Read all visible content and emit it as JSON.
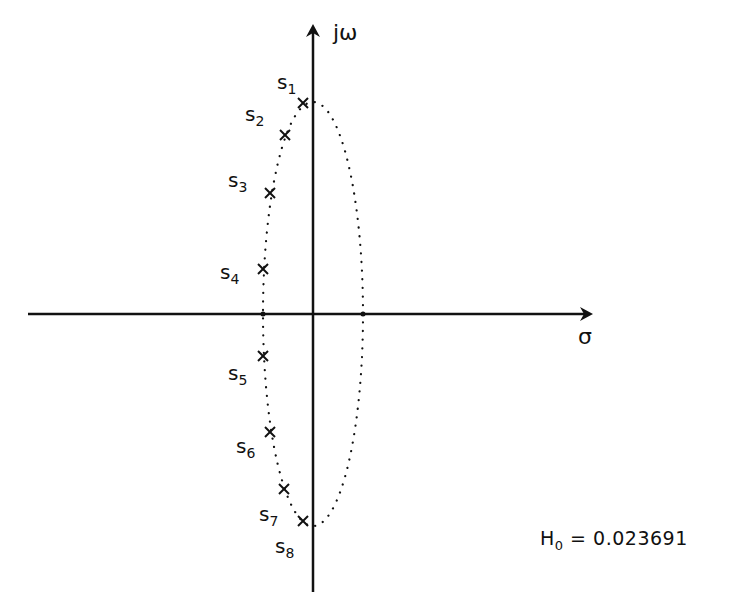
{
  "diagram": {
    "type": "s-plane pole plot",
    "axes": {
      "vertical_label": "jω",
      "horizontal_label": "σ",
      "origin_px": [
        313,
        314
      ]
    },
    "ellipse": {
      "center_px": [
        313,
        314
      ],
      "rx_px": 50,
      "ry_px": 212,
      "style": "dotted"
    },
    "poles": [
      {
        "name": "s",
        "index": "1",
        "px": [
          303,
          103
        ],
        "label_px": [
          277,
          72
        ]
      },
      {
        "name": "s",
        "index": "2",
        "px": [
          285,
          135
        ],
        "label_px": [
          245,
          104
        ]
      },
      {
        "name": "s",
        "index": "3",
        "px": [
          270,
          193
        ],
        "label_px": [
          228,
          170
        ]
      },
      {
        "name": "s",
        "index": "4",
        "px": [
          263,
          269
        ],
        "label_px": [
          220,
          262
        ]
      },
      {
        "name": "s",
        "index": "5",
        "px": [
          263,
          356
        ],
        "label_px": [
          228,
          363
        ]
      },
      {
        "name": "s",
        "index": "6",
        "px": [
          270,
          432
        ],
        "label_px": [
          236,
          436
        ]
      },
      {
        "name": "s",
        "index": "7",
        "px": [
          284,
          489
        ],
        "label_px": [
          259,
          504
        ]
      },
      {
        "name": "s",
        "index": "8",
        "px": [
          303,
          521
        ],
        "label_px": [
          275,
          536
        ]
      }
    ],
    "gain": {
      "symbol": "H",
      "subscript": "0",
      "equals": " = ",
      "value": "0.023691"
    }
  }
}
